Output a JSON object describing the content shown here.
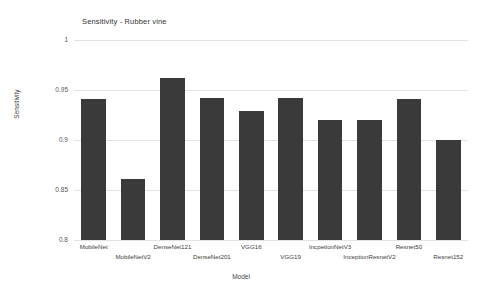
{
  "chart_data": {
    "type": "bar",
    "title": "Sensitivity - Rubber vine",
    "xlabel": "Model",
    "ylabel": "Sensitivity",
    "categories": [
      "MobileNet",
      "MobileNetV2",
      "DenseNet121",
      "DenseNet201",
      "VGG16",
      "VGG19",
      "IncpetionNetV3",
      "InceptionResnetV2",
      "Resnet50",
      "Resnet152"
    ],
    "values": [
      0.941,
      0.861,
      0.962,
      0.942,
      0.929,
      0.942,
      0.92,
      0.92,
      0.941,
      0.9
    ],
    "ylim": [
      0.8,
      1.0
    ],
    "yticks": [
      1,
      0.95,
      0.9,
      0.85,
      0.8
    ],
    "ytick_labels": [
      "1",
      "0.95",
      "0.9",
      "0.85",
      "0.8"
    ],
    "grid": true,
    "legend": false,
    "bar_color": "#3a3a3a",
    "grid_color": "#e2e2e2",
    "background": "#ffffff"
  }
}
